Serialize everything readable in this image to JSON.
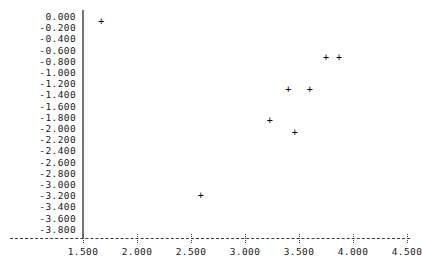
{
  "chart_data": {
    "type": "scatter",
    "title": "",
    "subtitle": "",
    "xlabel": "",
    "ylabel": "",
    "marker": "+",
    "marker_color": "#000000",
    "grid": false,
    "legend": null,
    "xlim": [
      1.32,
      4.65
    ],
    "ylim": [
      -3.95,
      0.12
    ],
    "xticks": [
      1.5,
      2.0,
      2.5,
      3.0,
      3.5,
      4.0,
      4.5
    ],
    "xticklabels": [
      "1.500",
      "2.000",
      "2.500",
      "3.000",
      "3.500",
      "4.000",
      "4.500"
    ],
    "yticks": [
      0.0,
      -0.2,
      -0.4,
      -0.6,
      -0.8,
      -1.0,
      -1.2,
      -1.4,
      -1.6,
      -1.8,
      -2.0,
      -2.2,
      -2.4,
      -2.6,
      -2.8,
      -3.0,
      -3.2,
      -3.4,
      -3.6,
      -3.8
    ],
    "yticklabels": [
      "0.000",
      "-0.200",
      "-0.400",
      "-0.600",
      "-0.800",
      "-1.000",
      "-1.200",
      "-1.400",
      "-1.600",
      "-1.800",
      "-2.000",
      "-2.200",
      "-2.400",
      "-2.600",
      "-2.800",
      "-3.000",
      "-3.200",
      "-3.400",
      "-3.600",
      "-3.800"
    ],
    "points": [
      {
        "x": 1.67,
        "y": -0.09
      },
      {
        "x": 2.59,
        "y": -3.2
      },
      {
        "x": 3.23,
        "y": -1.86
      },
      {
        "x": 3.4,
        "y": -1.3
      },
      {
        "x": 3.46,
        "y": -2.07
      },
      {
        "x": 3.6,
        "y": -1.3
      },
      {
        "x": 3.75,
        "y": -0.73
      },
      {
        "x": 3.87,
        "y": -0.73
      }
    ],
    "x": [
      1.67,
      2.59,
      3.23,
      3.4,
      3.46,
      3.6,
      3.75,
      3.87
    ],
    "values": [
      -0.09,
      -3.2,
      -1.86,
      -1.3,
      -2.07,
      -1.3,
      -0.73,
      -0.73
    ],
    "axis_style": {
      "y_axis": "solid",
      "x_axis": "dashed",
      "x_tick_glyph": "colon"
    }
  }
}
